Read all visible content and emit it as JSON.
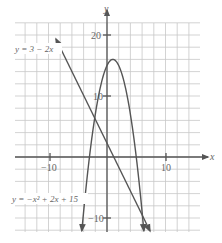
{
  "chart_data": {
    "type": "line",
    "title": "",
    "xlabel": "x",
    "ylabel": "y",
    "xlim": [
      -16,
      16
    ],
    "ylim": [
      -12,
      22
    ],
    "grid": true,
    "grid_step": 2,
    "x_ticks": [
      {
        "value": -10,
        "label": "-10"
      },
      {
        "value": 10,
        "label": "10"
      }
    ],
    "y_ticks": [
      {
        "value": 20,
        "label": "20"
      },
      {
        "value": 10,
        "label": "10"
      },
      {
        "value": -10,
        "label": "-10"
      }
    ],
    "series": [
      {
        "name": "y = 3 - 2x",
        "kind": "linear",
        "equation": "y = 3 - 2x",
        "points": [
          [
            -5,
            13
          ],
          [
            0,
            3
          ],
          [
            1.5,
            0
          ],
          [
            7,
            -11
          ]
        ],
        "arrows": "both"
      },
      {
        "name": "y = -x^2 + 2x + 15",
        "kind": "quadratic",
        "equation": "y = -x² + 2x + 15",
        "vertex": [
          1,
          16
        ],
        "x_intercepts": [
          -3,
          5
        ],
        "y_intercept": 15,
        "points": [
          [
            -4.3,
            -11
          ],
          [
            -3,
            0
          ],
          [
            0,
            15
          ],
          [
            1,
            16
          ],
          [
            2,
            15
          ],
          [
            5,
            0
          ],
          [
            6.3,
            -11
          ]
        ],
        "arrows": "both-down"
      }
    ],
    "annotations": [
      {
        "text": "y = 3 − 2x",
        "near": "upper-left line end"
      },
      {
        "text": "y = −x² + 2x + 15",
        "near": "lower-left parabola branch"
      }
    ]
  },
  "labels": {
    "x_axis": "x",
    "y_axis": "y",
    "tick_x_neg10": "−10",
    "tick_x_10": "10",
    "tick_y_20": "20",
    "tick_y_10": "10",
    "tick_y_neg10": "−10",
    "line_eq": "y = 3 − 2x",
    "parabola_eq": "y = −x² + 2x + 15"
  }
}
